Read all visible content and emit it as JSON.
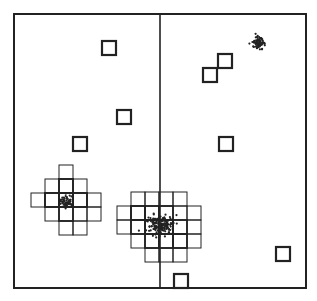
{
  "diagram": {
    "type": "spatial-grid-clustering",
    "frame": {
      "x": 14,
      "y": 14,
      "w": 292,
      "h": 274,
      "stroke": "#222222"
    },
    "divider": {
      "x": 160
    },
    "cell_size": 14,
    "isolated_squares": [
      {
        "x": 102,
        "y": 41
      },
      {
        "x": 117,
        "y": 110
      },
      {
        "x": 73,
        "y": 137
      },
      {
        "x": 203,
        "y": 68
      },
      {
        "x": 218,
        "y": 54
      },
      {
        "x": 219,
        "y": 137
      },
      {
        "x": 276,
        "y": 247
      },
      {
        "x": 174,
        "y": 274
      }
    ],
    "clusters": [
      {
        "name": "left-cluster",
        "center": {
          "x": 67,
          "y": 202
        },
        "cells_thin": [
          [
            59,
            165
          ],
          [
            45,
            179
          ],
          [
            59,
            179
          ],
          [
            73,
            179
          ],
          [
            31,
            193
          ],
          [
            45,
            193
          ],
          [
            73,
            193
          ],
          [
            87,
            193
          ],
          [
            45,
            207
          ],
          [
            73,
            207
          ],
          [
            87,
            207
          ],
          [
            59,
            221
          ],
          [
            73,
            221
          ]
        ],
        "cells_bold": [
          [
            59,
            179
          ],
          [
            45,
            193
          ],
          [
            59,
            193
          ],
          [
            73,
            193
          ],
          [
            59,
            207
          ]
        ],
        "points": 60,
        "spread": 7
      },
      {
        "name": "center-cluster",
        "center": {
          "x": 160,
          "y": 225
        },
        "cells_thin": [
          [
            131,
            192
          ],
          [
            145,
            192
          ],
          [
            159,
            192
          ],
          [
            173,
            192
          ],
          [
            117,
            206
          ],
          [
            131,
            206
          ],
          [
            173,
            206
          ],
          [
            187,
            206
          ],
          [
            117,
            220
          ],
          [
            187,
            220
          ],
          [
            131,
            234
          ],
          [
            187,
            234
          ],
          [
            145,
            248
          ],
          [
            159,
            248
          ],
          [
            173,
            248
          ]
        ],
        "cells_bold": [
          [
            131,
            206
          ],
          [
            145,
            206
          ],
          [
            159,
            206
          ],
          [
            131,
            220
          ],
          [
            145,
            220
          ],
          [
            159,
            220
          ],
          [
            173,
            220
          ],
          [
            145,
            234
          ],
          [
            159,
            234
          ],
          [
            173,
            234
          ]
        ],
        "points": 180,
        "spread": 11
      },
      {
        "name": "top-right-cluster",
        "center": {
          "x": 259,
          "y": 43
        },
        "cells_thin": [],
        "cells_bold": [],
        "points": 70,
        "spread": 6
      }
    ],
    "colors": {
      "ink": "#222222",
      "background": "#ffffff"
    }
  }
}
